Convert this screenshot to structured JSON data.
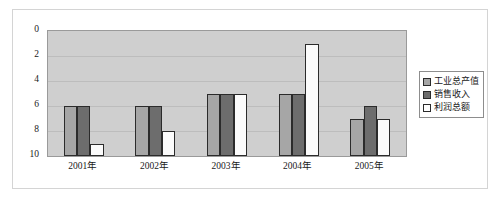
{
  "chart_data": {
    "type": "bar",
    "title": "",
    "xlabel": "",
    "ylabel": "",
    "categories": [
      "2001年",
      "2002年",
      "2003年",
      "2004年",
      "2005年"
    ],
    "series": [
      {
        "name": "工业总产值",
        "color": "#a6a6a6",
        "values": [
          6,
          6,
          5,
          5,
          7
        ]
      },
      {
        "name": "销售收入",
        "color": "#6d6d6d",
        "values": [
          6,
          6,
          5,
          5,
          6
        ]
      },
      {
        "name": "利润总额",
        "color": "#ffffff",
        "values": [
          9,
          8,
          5,
          1,
          7
        ]
      }
    ],
    "ylim": [
      0,
      10
    ],
    "y_inverted": true,
    "yticks": [
      0,
      2,
      4,
      6,
      8,
      10
    ],
    "ytick_labels": [
      "0",
      "2",
      "4",
      "6",
      "8",
      "10"
    ],
    "grid": true,
    "legend_position": "right",
    "plot_background": "#cfcfcf"
  }
}
